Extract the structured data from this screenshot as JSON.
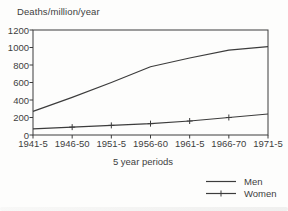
{
  "chart_data": {
    "type": "line",
    "title": "Deaths/million/year",
    "xlabel": "5 year periods",
    "categories": [
      "1941-5",
      "1946-50",
      "1951-5",
      "1956-60",
      "1961-5",
      "1966-70",
      "1971-5"
    ],
    "series": [
      {
        "name": "Men",
        "marker": "none",
        "values": [
          270,
          430,
          600,
          780,
          880,
          970,
          1010
        ]
      },
      {
        "name": "Women",
        "marker": "plus",
        "values": [
          70,
          90,
          110,
          130,
          160,
          200,
          240
        ]
      }
    ],
    "ylim": [
      0,
      1200
    ],
    "ytick_step": 200,
    "ytick_labels": [
      "1200",
      "1000",
      "800",
      "600",
      "400",
      "200",
      "0"
    ],
    "grid": "off",
    "legend_position": "bottom-right",
    "line_color": "#3c3c3c",
    "text_color": "#3e3e3e",
    "background": "#fdfdfc"
  }
}
